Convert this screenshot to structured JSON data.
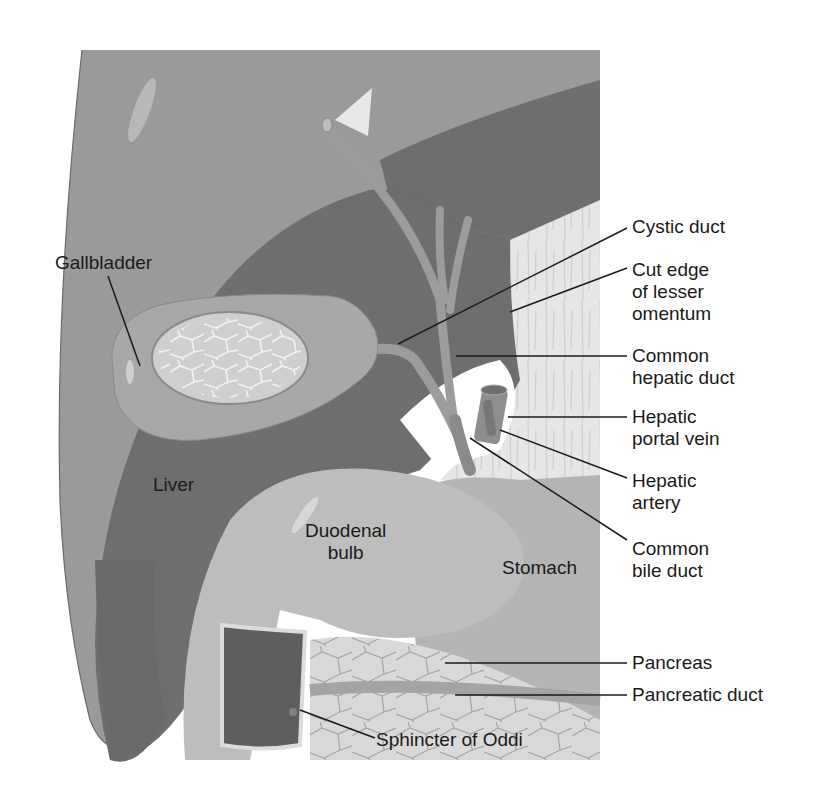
{
  "figure": {
    "type": "anatomical-diagram",
    "colors": {
      "background": "#ffffff",
      "liver_light": "#9a9a9a",
      "liver_dark": "#6e6e6e",
      "gallbladder": "#a8a8a8",
      "gallbladder_inner": "#cfcfcf",
      "duct": "#9c9c9c",
      "omentum": "#e6e6e6",
      "stomach": "#b4b4b4",
      "duodenum": "#bdbdbd",
      "pancreas": "#d9d9d9",
      "duodenal_wall": "#5e5e5e",
      "leader_line": "#1a1a1a",
      "text": "#1a1a1a"
    }
  },
  "labels": {
    "gallbladder": "Gallbladder",
    "liver": "Liver",
    "duodenal_bulb": "Duodenal\nbulb",
    "stomach": "Stomach",
    "sphincter_of_oddi": "Sphincter of Oddi",
    "cystic_duct": "Cystic duct",
    "cut_edge_lesser_omentum": "Cut edge\nof lesser\nomentum",
    "common_hepatic_duct": "Common\nhepatic duct",
    "hepatic_portal_vein": "Hepatic\nportal vein",
    "hepatic_artery": "Hepatic\nartery",
    "common_bile_duct": "Common\nbile duct",
    "pancreas": "Pancreas",
    "pancreatic_duct": "Pancreatic duct"
  }
}
